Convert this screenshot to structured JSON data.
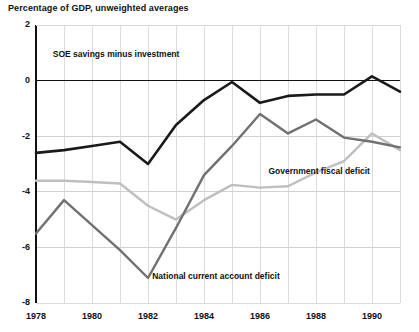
{
  "chart_data": {
    "type": "line",
    "title": "Percentage of GDP, unweighted averages",
    "xlabel": "",
    "ylabel": "",
    "xlim": [
      1978,
      1991
    ],
    "ylim": [
      -8,
      2
    ],
    "grid": true,
    "legend_position": "inline-annotations",
    "x": [
      1978,
      1979,
      1980,
      1981,
      1982,
      1983,
      1984,
      1985,
      1986,
      1987,
      1988,
      1989,
      1990,
      1991
    ],
    "xticks": [
      1978,
      1980,
      1982,
      1984,
      1986,
      1988,
      1990
    ],
    "xtick_labels": [
      "1978",
      "1980",
      "1982",
      "1984",
      "1986",
      "1988",
      "1990"
    ],
    "yticks": [
      2,
      0,
      -2,
      -4,
      -6,
      -8
    ],
    "ytick_labels": [
      "2",
      "0",
      "-2",
      "-4",
      "-6",
      "-8"
    ],
    "series": [
      {
        "name": "SOE savings minus investment",
        "color": "#1a1a1a",
        "width": 2.6,
        "values": [
          -2.6,
          -2.5,
          -2.35,
          -2.2,
          -3.0,
          -1.6,
          -0.7,
          -0.05,
          -0.8,
          -0.55,
          -0.5,
          -0.5,
          0.15,
          -0.4
        ],
        "label": "SOE savings minus investment",
        "label_x": 1978.6,
        "label_y": 0.85
      },
      {
        "name": "Government fiscal deficit",
        "color": "#bfbfbf",
        "width": 2.4,
        "values": [
          -3.6,
          -3.6,
          -3.65,
          -3.7,
          -4.5,
          -5.0,
          -4.3,
          -3.75,
          -3.85,
          -3.8,
          -3.3,
          -2.9,
          -1.9,
          -2.5
        ],
        "label": "Government fiscal deficit",
        "label_x": 1986.3,
        "label_y": -3.35
      },
      {
        "name": "National current account deficit",
        "color": "#707070",
        "width": 2.4,
        "values": [
          -5.5,
          -4.3,
          -5.2,
          -6.1,
          -7.1,
          -5.3,
          -3.4,
          -2.35,
          -1.2,
          -1.9,
          -1.4,
          -2.05,
          -2.2,
          -2.4
        ],
        "label": "National current account deficit",
        "label_x": 1982.15,
        "label_y": -7.15
      }
    ]
  }
}
